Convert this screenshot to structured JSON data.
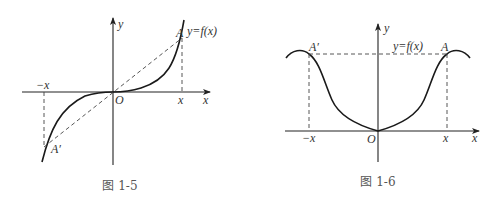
{
  "figures": [
    {
      "id": "fig-1-5",
      "caption": "图 1-5",
      "function_label": "y=f(x)",
      "axis_x_label": "x",
      "axis_y_label": "y",
      "origin_label": "O",
      "point_a_label": "A",
      "point_a_prime_label": "A′",
      "tick_pos_label": "x",
      "tick_neg_label": "−x",
      "description": "Odd function: curve symmetric about origin; dashed line connects A′ and A through O"
    },
    {
      "id": "fig-1-6",
      "caption": "图 1-6",
      "function_label": "y=f(x)",
      "axis_x_label": "x",
      "axis_y_label": "y",
      "origin_label": "O",
      "point_a_label": "A",
      "point_a_prime_label": "A′",
      "tick_pos_label": "x",
      "tick_neg_label": "−x",
      "description": "Even function: curve symmetric about y-axis; horizontal dashed line connects A′ and A"
    }
  ]
}
